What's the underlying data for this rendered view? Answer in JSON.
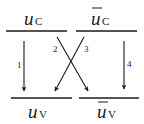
{
  "diagram": {
    "levels": {
      "top_left": {
        "base": "u",
        "sub": "C",
        "bar": false
      },
      "top_right": {
        "base": "u",
        "sub": "C",
        "bar": true
      },
      "bottom_left": {
        "base": "u",
        "sub": "V",
        "bar": false
      },
      "bottom_right": {
        "base": "u",
        "sub": "V",
        "bar": true
      }
    },
    "arrows": [
      {
        "label": "1",
        "from": "top_left",
        "to": "bottom_left"
      },
      {
        "label": "2",
        "from": "top_left",
        "to": "bottom_right"
      },
      {
        "label": "3",
        "from": "top_right",
        "to": "bottom_left"
      },
      {
        "label": "4",
        "from": "top_right",
        "to": "bottom_right"
      }
    ],
    "colors": {
      "stroke": "#1a1a1a",
      "background": "#ffffff"
    }
  }
}
